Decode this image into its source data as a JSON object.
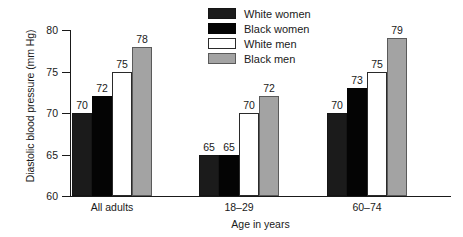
{
  "chart_data": {
    "type": "bar",
    "title": "",
    "xlabel": "Age in years",
    "ylabel": "Diastolic blood pressure (mm Hg)",
    "categories": [
      "All adults",
      "18–29",
      "60–74"
    ],
    "series": [
      {
        "name": "White women",
        "color": "#1b1b1b",
        "values": [
          70,
          65,
          70
        ]
      },
      {
        "name": "Black women",
        "color": "#040404",
        "values": [
          72,
          65,
          73
        ]
      },
      {
        "name": "White men",
        "color": "#ffffff",
        "values": [
          75,
          70,
          75
        ]
      },
      {
        "name": "Black men",
        "color": "#a3a3a3",
        "values": [
          78,
          72,
          79
        ]
      }
    ],
    "ylim": [
      60,
      80
    ],
    "yticks": [
      60,
      65,
      70,
      75,
      80
    ],
    "ytick_labels": [
      "60",
      "65",
      "70",
      "75",
      "80"
    ],
    "grid": false,
    "legend_position": "top-center",
    "bar_labels_shown": true
  },
  "axis": {
    "y_title": "Diastolic blood pressure (mm Hg)",
    "x_title": "Age in years"
  },
  "legend": {
    "items": [
      {
        "label": "White women"
      },
      {
        "label": "Black women"
      },
      {
        "label": "White men"
      },
      {
        "label": "Black men"
      }
    ]
  }
}
